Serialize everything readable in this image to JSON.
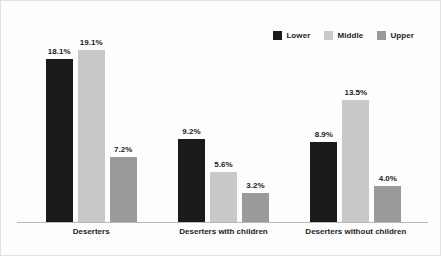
{
  "chart_data": {
    "type": "bar",
    "title": "",
    "subtitle": "",
    "xlabel": "",
    "ylabel": "",
    "ylim": [
      0,
      20.5
    ],
    "grid": false,
    "legend_position": "top-right",
    "value_suffix": "%",
    "categories": [
      "Deserters",
      "Deserters with children",
      "Deserters without children"
    ],
    "series": [
      {
        "name": "Lower",
        "color": "#1a1a1a",
        "values": [
          18.1,
          9.2,
          8.9
        ],
        "labels": [
          "18.1%",
          "9.2%",
          "8.9%"
        ]
      },
      {
        "name": "Middle",
        "color": "#c9c9c9",
        "values": [
          19.1,
          5.6,
          13.5
        ],
        "labels": [
          "19.1%",
          "5.6%",
          "13.5%"
        ]
      },
      {
        "name": "Upper",
        "color": "#9a9a9a",
        "values": [
          7.2,
          3.2,
          4.0
        ],
        "labels": [
          "7.2%",
          "3.2%",
          "4.0%"
        ]
      }
    ]
  },
  "legend": {
    "items": [
      {
        "label": "Lower",
        "color": "#1a1a1a"
      },
      {
        "label": "Middle",
        "color": "#c9c9c9"
      },
      {
        "label": "Upper",
        "color": "#9a9a9a"
      }
    ]
  },
  "colors": {
    "background": "#fdfdfd",
    "border": "#e2e2e2",
    "axis_line": "#b9b9b9",
    "text": "#231f20"
  }
}
